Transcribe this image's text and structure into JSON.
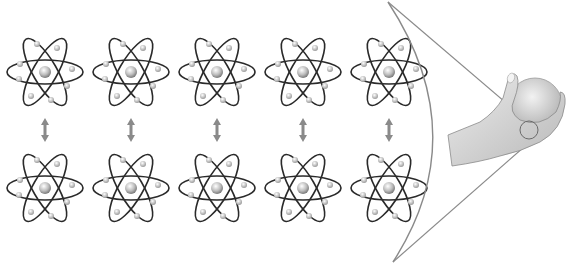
{
  "figure": {
    "rows": 2,
    "columns": 5,
    "atom_centers_x": [
      45,
      131,
      217,
      303,
      389
    ],
    "row_centers_y": [
      72,
      188
    ],
    "colors": {
      "orbit": "#2a2a2a",
      "electron": "#d8d8d8",
      "nucleus": "#c8c8c8",
      "arrow": "#8a8a8a",
      "cone_line": "#8a8a8a",
      "hand": "#d4d4d4"
    },
    "labels": []
  }
}
